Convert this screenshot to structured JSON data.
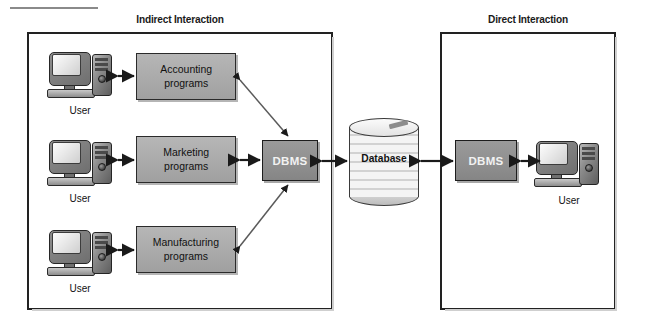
{
  "diagram": {
    "panels": [
      {
        "id": "indirect",
        "title": "Indirect Interaction"
      },
      {
        "id": "direct",
        "title": "Direct Interaction"
      }
    ],
    "program_boxes": [
      {
        "id": "accounting",
        "line1": "Accounting",
        "line2": "programs"
      },
      {
        "id": "marketing",
        "line1": "Marketing",
        "line2": "programs"
      },
      {
        "id": "manufacturing",
        "line1": "Manufacturing",
        "line2": "programs"
      }
    ],
    "dbms_indirect_label": "DBMS",
    "dbms_direct_label": "DBMS",
    "database_label": "Database",
    "user_labels": {
      "accounting_user": "User",
      "marketing_user": "User",
      "manufacturing_user": "User",
      "direct_user": "User"
    },
    "colors": {
      "panel_border": "#222222",
      "program_box_fill": "#a9a9a9",
      "dbms_box_fill": "#8f8f8f",
      "dbms_text": "#f2f2f2",
      "database_fill": "#f4f4f4",
      "arrow": "#1a1a1a",
      "background": "#ffffff"
    }
  }
}
